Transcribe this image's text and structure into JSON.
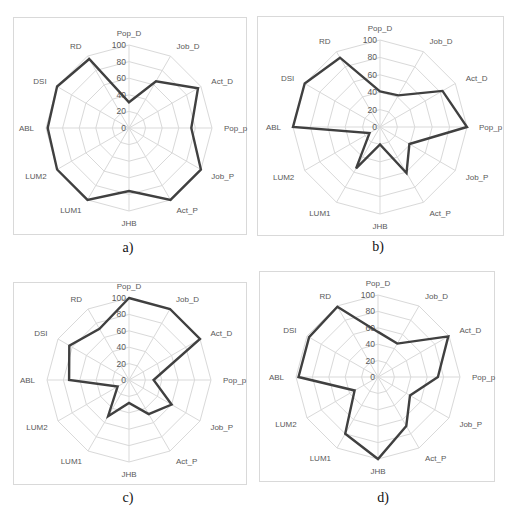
{
  "chart_data": [
    {
      "type": "radar",
      "caption": "a)",
      "axes": [
        "Pop_D",
        "Job_D",
        "Act_D",
        "Pop_p",
        "Job_P",
        "Act_P",
        "JHB",
        "LUM1",
        "LUM2",
        "ABL",
        "DSI",
        "RD"
      ],
      "values": [
        31,
        65,
        96,
        75,
        100,
        100,
        76,
        100,
        100,
        98,
        100,
        96
      ],
      "rlim": [
        0,
        100
      ],
      "rticks": [
        0,
        20,
        40,
        60,
        80,
        100
      ],
      "line_color": "#404040",
      "grid_color": "#d9d9d9"
    },
    {
      "type": "radar",
      "caption": "b)",
      "axes": [
        "Pop_D",
        "Job_D",
        "Act_D",
        "Pop_p",
        "Job_P",
        "Act_P",
        "JHB",
        "LUM1",
        "LUM2",
        "ABL",
        "DSI",
        "RD"
      ],
      "values": [
        41,
        42,
        83,
        100,
        39,
        61,
        20,
        55,
        14,
        100,
        100,
        92
      ],
      "rlim": [
        0,
        100
      ],
      "rticks": [
        0,
        20,
        40,
        60,
        80,
        100
      ],
      "line_color": "#404040",
      "grid_color": "#d9d9d9"
    },
    {
      "type": "radar",
      "caption": "c)",
      "axes": [
        "Pop_D",
        "Job_D",
        "Act_D",
        "Pop_p",
        "Job_P",
        "Act_P",
        "JHB",
        "LUM1",
        "LUM2",
        "ABL",
        "DSI",
        "RD"
      ],
      "values": [
        100,
        100,
        100,
        30,
        60,
        48,
        28,
        51,
        16,
        73,
        84,
        72
      ],
      "rlim": [
        0,
        100
      ],
      "rticks": [
        0,
        20,
        40,
        60,
        80,
        100
      ],
      "line_color": "#404040",
      "grid_color": "#d9d9d9"
    },
    {
      "type": "radar",
      "caption": "d)",
      "axes": [
        "Pop_D",
        "Job_D",
        "Act_D",
        "Pop_p",
        "Job_P",
        "Act_P",
        "JHB",
        "LUM1",
        "LUM2",
        "ABL",
        "DSI",
        "RD"
      ],
      "values": [
        55,
        47,
        99,
        73,
        45,
        69,
        100,
        80,
        33,
        97,
        97,
        99
      ],
      "rlim": [
        0,
        100
      ],
      "rticks": [
        0,
        20,
        40,
        60,
        80,
        100
      ],
      "line_color": "#404040",
      "grid_color": "#d9d9d9"
    }
  ],
  "panels": [
    {
      "id": "a",
      "box": [
        13,
        17,
        234,
        218
      ],
      "center": [
        128,
        127
      ],
      "radius": 83,
      "caption_pos": [
        128,
        240
      ]
    },
    {
      "id": "b",
      "box": [
        257,
        16,
        247,
        220
      ],
      "center": [
        379,
        126
      ],
      "radius": 87,
      "caption_pos": [
        378,
        239
      ]
    },
    {
      "id": "c",
      "box": [
        13,
        282,
        234,
        203
      ],
      "center": [
        128,
        379
      ],
      "radius": 82,
      "caption_pos": [
        128,
        490
      ]
    },
    {
      "id": "d",
      "box": [
        259,
        271,
        236,
        211
      ],
      "center": [
        377,
        376
      ],
      "radius": 82,
      "caption_pos": [
        383,
        490
      ]
    }
  ]
}
